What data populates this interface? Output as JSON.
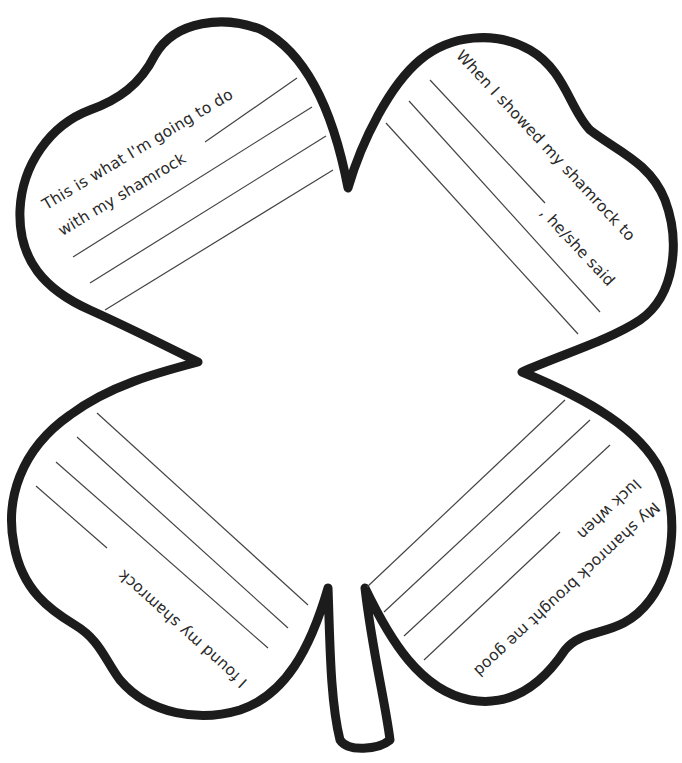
{
  "worksheet": {
    "title": "Shamrock writing worksheet",
    "outline_color": "#1c1c1c",
    "line_color": "#444444",
    "leaves": [
      {
        "id": "top-left",
        "prompt_line1": "This is what I'm going to do",
        "prompt_line2": "with my shamrock",
        "writing_lines": 4
      },
      {
        "id": "top-right",
        "prompt_line1": "When I showed my shamrock to",
        "prompt_line2": ", he/she said",
        "writing_lines": 3
      },
      {
        "id": "bottom-left",
        "prompt_line1": "I found my shamrock",
        "writing_lines": 4
      },
      {
        "id": "bottom-right",
        "prompt_line1": "My shamrock brought me good",
        "prompt_line2": "luck when",
        "writing_lines": 4
      }
    ]
  }
}
